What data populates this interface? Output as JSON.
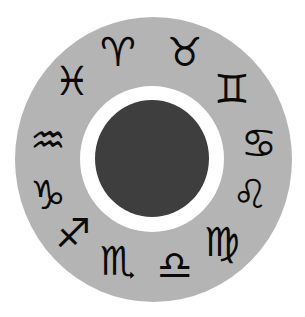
{
  "wheel": {
    "colors": {
      "background": "#ffffff",
      "outer_ring": "#b4b4b4",
      "inner_ring": "#ffffff",
      "core": "#3e3e3e",
      "glyph": "#0a0a0a"
    },
    "signs": [
      {
        "name": "aries",
        "glyph": "♈",
        "cx": 118,
        "cy": 52
      },
      {
        "name": "taurus",
        "glyph": "♉",
        "cx": 185,
        "cy": 52
      },
      {
        "name": "gemini",
        "glyph": "♊",
        "cx": 232,
        "cy": 89
      },
      {
        "name": "cancer",
        "glyph": "♋",
        "cx": 259,
        "cy": 143
      },
      {
        "name": "leo",
        "glyph": "♌",
        "cx": 250,
        "cy": 194
      },
      {
        "name": "virgo",
        "glyph": "♍",
        "cx": 222,
        "cy": 242
      },
      {
        "name": "libra",
        "glyph": "♎",
        "cx": 175,
        "cy": 265
      },
      {
        "name": "scorpio",
        "glyph": "♏",
        "cx": 118,
        "cy": 261
      },
      {
        "name": "sagittarius",
        "glyph": "♐",
        "cx": 73,
        "cy": 233
      },
      {
        "name": "capricorn",
        "glyph": "♑",
        "cx": 48,
        "cy": 195
      },
      {
        "name": "aquarius",
        "glyph": "♒",
        "cx": 48,
        "cy": 140
      },
      {
        "name": "pisces",
        "glyph": "♓",
        "cx": 72,
        "cy": 81
      }
    ]
  }
}
